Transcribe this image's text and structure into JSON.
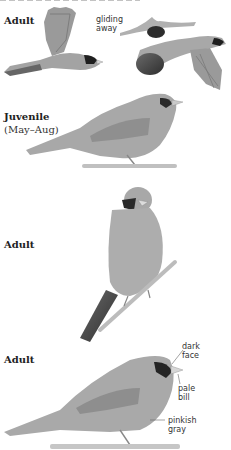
{
  "page": {
    "sections": [
      {
        "label": "Adult",
        "note_lines": [
          "gliding",
          "away"
        ]
      },
      {
        "label": "Juvenile",
        "sublabel": "(May–Aug)"
      },
      {
        "label": "Adult"
      },
      {
        "label": "Adult",
        "annotations": [
          {
            "lines": [
              "dark",
              "face"
            ]
          },
          {
            "lines": [
              "pale",
              "bill"
            ]
          },
          {
            "lines": [
              "pinkish",
              "gray"
            ]
          }
        ]
      }
    ]
  }
}
